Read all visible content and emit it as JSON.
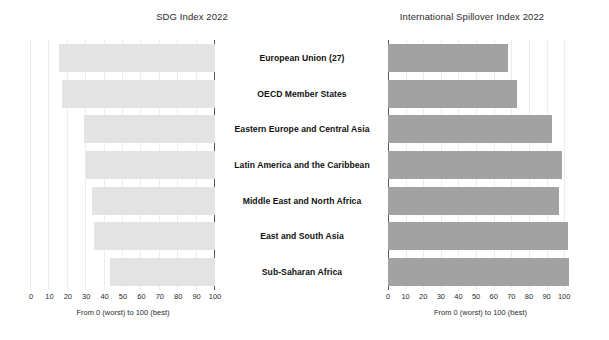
{
  "figure": {
    "categories": [
      "European Union (27)",
      "OECD Member States",
      "Eastern Europe and Central Asia",
      "Latin America and the Caribbean",
      "Middle East and North Africa",
      "East and South Asia",
      "Sub-Saharan Africa"
    ],
    "left_panel": {
      "title": "SDG Index 2022",
      "axis_caption": "From 0 (worst) to 100 (best)",
      "tick_labels": [
        "100",
        "90",
        "80",
        "70",
        "60",
        "50",
        "40",
        "30",
        "20",
        "10",
        "0"
      ]
    },
    "right_panel": {
      "title": "International Spillover Index 2022",
      "axis_caption": "From 0 (worst) to 100 (best)",
      "tick_labels": [
        "0",
        "10",
        "20",
        "30",
        "40",
        "50",
        "60",
        "70",
        "80",
        "90",
        "100"
      ]
    },
    "colors": {
      "bar_light": "#e3e3e3",
      "bar_dark": "#a2a2a2",
      "gridline": "#ededed",
      "axis_spine": "#55595c",
      "text": "#111111"
    }
  },
  "chart_data": [
    {
      "type": "bar",
      "orientation": "horizontal",
      "direction": "right-to-left",
      "title": "SDG Index 2022",
      "xlabel": "From 0 (worst) to 100 (best)",
      "ylabel": "",
      "xlim": [
        100,
        0
      ],
      "ticks": [
        100,
        90,
        80,
        70,
        60,
        50,
        40,
        30,
        20,
        10,
        0
      ],
      "grid": true,
      "legend": "none",
      "bar_color": "#e3e3e3",
      "categories": [
        "European Union (27)",
        "OECD Member States",
        "Eastern Europe and Central Asia",
        "Latin America and the Caribbean",
        "Middle East and North Africa",
        "East and South Asia",
        "Sub-Saharan Africa"
      ],
      "values": [
        85,
        83,
        71,
        70,
        67,
        66,
        57
      ]
    },
    {
      "type": "bar",
      "orientation": "horizontal",
      "direction": "left-to-right",
      "title": "International Spillover Index 2022",
      "xlabel": "From 0 (worst) to 100 (best)",
      "ylabel": "",
      "xlim": [
        0,
        105
      ],
      "ticks": [
        0,
        10,
        20,
        30,
        40,
        50,
        60,
        70,
        80,
        90,
        100
      ],
      "grid": true,
      "legend": "none",
      "bar_color": "#a2a2a2",
      "categories": [
        "European Union (27)",
        "OECD Member States",
        "Eastern Europe and Central Asia",
        "Latin America and the Caribbean",
        "Middle East and North Africa",
        "East and South Asia",
        "Sub-Saharan Africa"
      ],
      "values": [
        68,
        73,
        93,
        99,
        97,
        102,
        103
      ]
    }
  ]
}
